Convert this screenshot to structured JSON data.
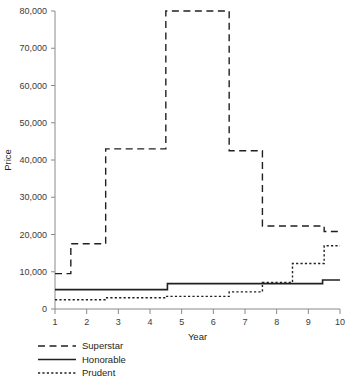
{
  "chart_data": {
    "type": "line",
    "subtype": "step",
    "title": "",
    "xlabel": "Year",
    "ylabel": "Price",
    "xlim": [
      1,
      10
    ],
    "ylim": [
      0,
      80000
    ],
    "grid": false,
    "legend_position": "bottom-left",
    "x_ticks": [
      1,
      2,
      3,
      4,
      5,
      6,
      7,
      8,
      9,
      10
    ],
    "x_tick_labels": [
      "1",
      "2",
      "3",
      "4",
      "5",
      "6",
      "7",
      "8",
      "9",
      "10"
    ],
    "y_ticks": [
      0,
      10000,
      20000,
      30000,
      40000,
      50000,
      60000,
      70000,
      80000
    ],
    "y_tick_labels": [
      "0",
      "10,000",
      "20,000",
      "30,000",
      "40,000",
      "50,000",
      "60,000",
      "70,000",
      "80,000"
    ],
    "series": [
      {
        "name": "Superstar",
        "style": "dashed",
        "color": "#231f20",
        "steps": [
          {
            "x_start": 1.0,
            "x_end": 1.5,
            "y": 9500
          },
          {
            "x_start": 1.5,
            "x_end": 2.6,
            "y": 17500
          },
          {
            "x_start": 2.6,
            "x_end": 4.5,
            "y": 43000
          },
          {
            "x_start": 4.5,
            "x_end": 6.5,
            "y": 80000
          },
          {
            "x_start": 6.5,
            "x_end": 7.55,
            "y": 42500
          },
          {
            "x_start": 7.55,
            "x_end": 9.5,
            "y": 22300
          },
          {
            "x_start": 9.5,
            "x_end": 10.0,
            "y": 20800
          }
        ]
      },
      {
        "name": "Honorable",
        "style": "solid",
        "color": "#231f20",
        "steps": [
          {
            "x_start": 1.0,
            "x_end": 4.55,
            "y": 5200
          },
          {
            "x_start": 4.55,
            "x_end": 9.45,
            "y": 6800
          },
          {
            "x_start": 9.45,
            "x_end": 10.0,
            "y": 7800
          }
        ]
      },
      {
        "name": "Prudent",
        "style": "dotted",
        "color": "#231f20",
        "steps": [
          {
            "x_start": 1.0,
            "x_end": 2.6,
            "y": 2500
          },
          {
            "x_start": 2.6,
            "x_end": 4.5,
            "y": 3000
          },
          {
            "x_start": 4.5,
            "x_end": 6.5,
            "y": 3400
          },
          {
            "x_start": 6.5,
            "x_end": 7.55,
            "y": 4600
          },
          {
            "x_start": 7.55,
            "x_end": 8.5,
            "y": 7100
          },
          {
            "x_start": 8.5,
            "x_end": 9.5,
            "y": 12200
          },
          {
            "x_start": 9.5,
            "x_end": 10.0,
            "y": 17000
          }
        ]
      }
    ]
  },
  "legend": {
    "items": [
      {
        "label": "Superstar",
        "style": "dashed"
      },
      {
        "label": "Honorable",
        "style": "solid"
      },
      {
        "label": "Prudent",
        "style": "dotted"
      }
    ]
  }
}
